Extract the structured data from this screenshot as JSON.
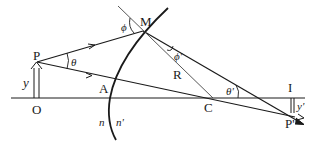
{
  "diagram": {
    "labels": {
      "P": "P",
      "M": "M",
      "A": "A",
      "O": "O",
      "C": "C",
      "R": "R",
      "I": "I",
      "P_prime": "P'",
      "y": "y",
      "y_prime": "y'",
      "theta": "θ",
      "theta_prime": "θ'",
      "phi": "ϕ",
      "phi_prime": "ϕ'",
      "n": "n",
      "n_prime": "n'"
    },
    "colors": {
      "line": "#1a1a1a",
      "normal": "#444444",
      "background": "#ffffff"
    }
  }
}
